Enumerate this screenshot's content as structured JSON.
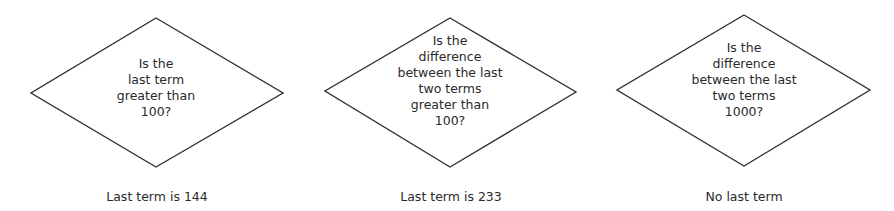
{
  "diagram": {
    "stroke_color": "#333333",
    "decisions": [
      {
        "lines": [
          "Is the",
          "last term",
          "greater than",
          "100?"
        ],
        "caption": "Last term is 144"
      },
      {
        "lines": [
          "Is the",
          "difference",
          "between the last",
          "two terms",
          "greater than",
          "100?"
        ],
        "caption": "Last term is 233"
      },
      {
        "lines": [
          "Is the",
          "difference",
          "between the last",
          "two terms",
          "1000?"
        ],
        "caption": "No last term"
      }
    ]
  }
}
